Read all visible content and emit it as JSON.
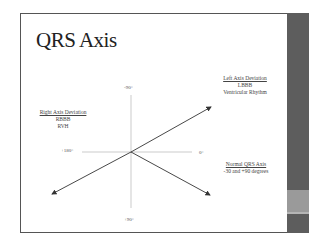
{
  "slide": {
    "title": "QRS Axis",
    "degrees": {
      "top": "-90°",
      "left": "+180°",
      "right": "0°",
      "bottom": "+90°"
    },
    "left_axis_deviation": {
      "heading": "Left Axis Deviation",
      "lines": [
        "LBBB",
        "Ventricular Rhythm"
      ]
    },
    "right_axis_deviation": {
      "heading": "Right Axis Deviation",
      "lines": [
        "RBBB",
        "RVH"
      ]
    },
    "normal_axis": {
      "heading": "Normal QRS Axis",
      "lines": [
        "-30 and +90 degrees"
      ]
    }
  },
  "colors": {
    "sidebar": "#5d5d5d",
    "sidebar_band": "#9a9a9a",
    "border": "#555555",
    "text": "#222222"
  }
}
